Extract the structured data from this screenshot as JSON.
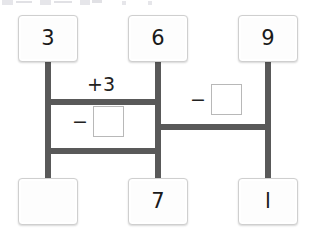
{
  "diagram": {
    "type": "bar-model-number-chain",
    "top_cards": [
      {
        "id": "top-left",
        "value": "3",
        "filled": true,
        "x": 18,
        "y": 15,
        "w": 60,
        "h": 47
      },
      {
        "id": "top-middle",
        "value": "6",
        "filled": true,
        "x": 128,
        "y": 15,
        "w": 60,
        "h": 47
      },
      {
        "id": "top-right",
        "value": "9",
        "filled": true,
        "x": 238,
        "y": 15,
        "w": 60,
        "h": 47
      }
    ],
    "bottom_cards": [
      {
        "id": "bottom-left",
        "value": "",
        "filled": false,
        "x": 18,
        "y": 178,
        "w": 60,
        "h": 47
      },
      {
        "id": "bottom-middle",
        "value": "7",
        "filled": true,
        "x": 128,
        "y": 178,
        "w": 60,
        "h": 47
      },
      {
        "id": "bottom-right",
        "value": "l",
        "filled": true,
        "x": 238,
        "y": 178,
        "w": 60,
        "h": 47
      }
    ],
    "operations": [
      {
        "id": "op-add-three",
        "sign": "+",
        "operand": "3",
        "has_blank": false,
        "x": 80,
        "y": 76
      },
      {
        "id": "op-minus-left",
        "sign": "−",
        "operand": "",
        "has_blank": true,
        "x": 72,
        "y": 110
      },
      {
        "id": "op-minus-right",
        "sign": "−",
        "operand": "",
        "has_blank": true,
        "x": 190,
        "y": 88
      }
    ],
    "connectors": [
      {
        "id": "vline-left",
        "orient": "v",
        "x": 45,
        "y": 60,
        "length": 120
      },
      {
        "id": "vline-middle",
        "orient": "v",
        "x": 155,
        "y": 60,
        "length": 120
      },
      {
        "id": "vline-right",
        "orient": "v",
        "x": 265,
        "y": 60,
        "length": 120
      },
      {
        "id": "hline-top",
        "orient": "h",
        "x": 45,
        "y": 99,
        "length": 116
      },
      {
        "id": "hline-bottom",
        "orient": "h",
        "x": 45,
        "y": 148,
        "length": 116
      },
      {
        "id": "hline-right",
        "orient": "h",
        "x": 155,
        "y": 124,
        "length": 116
      }
    ],
    "colors": {
      "bar": "#595959",
      "card_border": "#cfcfcf",
      "card_fill": "#fdfdfd",
      "blank_border": "#b8b8b8",
      "text": "#1a1a1a",
      "background": "#ffffff"
    }
  }
}
